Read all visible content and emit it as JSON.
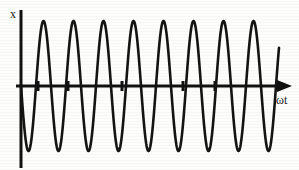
{
  "figure": {
    "y_axis_label": "x",
    "x_axis_label": "ωt",
    "stroke_color": "#141414",
    "axis_color": "#111111",
    "background_color": "#fdfdfc"
  },
  "chart_data": {
    "type": "line",
    "title": "",
    "subtitle": "",
    "xlabel": "ωt",
    "ylabel": "x",
    "grid": false,
    "legend": null,
    "axis": {
      "x_axis_y_pixel": 86,
      "y_axis_x_pixel": 21,
      "x_start": 21,
      "x_end": 279,
      "y_top": 10,
      "y_bottom": 168
    },
    "xlim": [
      0,
      8.6
    ],
    "ylim": [
      -1.12,
      1.12
    ],
    "amplitude": 1.0,
    "cycles": 8.6,
    "phase": "starts at zero descending (negative sine)",
    "peak_y_pixel": 22,
    "trough_y_pixel": 152,
    "tick_marks": {
      "count": 5,
      "x_positions_cycles": [
        0.55,
        1.55,
        3.35,
        5.4,
        6.45
      ],
      "x_positions_pixels": [
        38,
        68,
        122,
        183,
        215
      ],
      "labels": []
    },
    "peaks_x_pixels": [
      38,
      68,
      98,
      128,
      158,
      188,
      218,
      248
    ],
    "troughs_x_pixels": [
      28,
      53,
      83,
      113,
      143,
      173,
      203,
      233,
      259
    ],
    "series": [
      {
        "name": "x(ωt)",
        "description": "constant-amplitude sinusoid, negative sine phase",
        "x": [
          0.0,
          0.125,
          0.25,
          0.375,
          0.5,
          0.625,
          0.75,
          0.875,
          1.0,
          1.125,
          1.25,
          1.375,
          1.5,
          1.625,
          1.75,
          1.875,
          2.0,
          2.125,
          2.25,
          2.375,
          2.5,
          2.625,
          2.75,
          2.875,
          3.0,
          3.125,
          3.25,
          3.375,
          3.5,
          3.625,
          3.75,
          3.875,
          4.0,
          4.125,
          4.25,
          4.375,
          4.5,
          4.625,
          4.75,
          4.875,
          5.0,
          5.125,
          5.25,
          5.375,
          5.5,
          5.625,
          5.75,
          5.875,
          6.0,
          6.125,
          6.25,
          6.375,
          6.5,
          6.625,
          6.75,
          6.875,
          7.0,
          7.125,
          7.25,
          7.375,
          7.5,
          7.625,
          7.75,
          7.875,
          8.0,
          8.125,
          8.25,
          8.375,
          8.5
        ],
        "values": [
          0.0,
          -0.71,
          -1.0,
          -0.71,
          0.0,
          0.71,
          1.0,
          0.71,
          0.0,
          -0.71,
          -1.0,
          -0.71,
          0.0,
          0.71,
          1.0,
          0.71,
          0.0,
          -0.71,
          -1.0,
          -0.71,
          0.0,
          0.71,
          1.0,
          0.71,
          0.0,
          -0.71,
          -1.0,
          -0.71,
          0.0,
          0.71,
          1.0,
          0.71,
          0.0,
          -0.71,
          -1.0,
          -0.71,
          0.0,
          0.71,
          1.0,
          0.71,
          0.0,
          -0.71,
          -1.0,
          -0.71,
          0.0,
          0.71,
          1.0,
          0.71,
          0.0,
          -0.71,
          -1.0,
          -0.71,
          0.0,
          0.71,
          1.0,
          0.71,
          0.0,
          -0.71,
          -1.0,
          -0.71,
          0.0,
          0.71,
          1.0,
          0.71,
          0.0,
          -0.71,
          -1.0,
          -0.71,
          0.0
        ]
      }
    ]
  }
}
